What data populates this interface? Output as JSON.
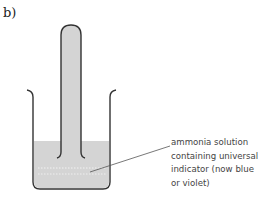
{
  "figure": {
    "part_label": "b)",
    "annotation_lines": [
      "ammonia solution",
      "containing universal",
      "indicator (now blue",
      "or violet)"
    ],
    "colors": {
      "liquid": "#d4d4d4",
      "outline": "#333333",
      "leader": "#555555"
    }
  }
}
